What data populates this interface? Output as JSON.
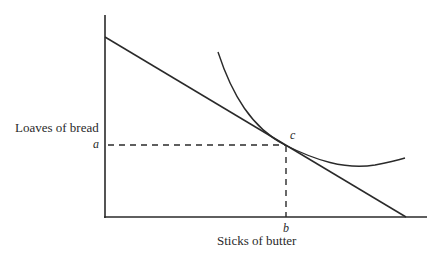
{
  "diagram": {
    "y_axis_label": "Loaves of bread",
    "x_axis_label": "Sticks of butter",
    "point_labels": {
      "y_intercept_marker": "a",
      "x_intercept_marker": "b",
      "tangency_point": "c"
    },
    "elements": [
      {
        "type": "axis",
        "name": "y-axis"
      },
      {
        "type": "axis",
        "name": "x-axis"
      },
      {
        "type": "line",
        "name": "budget-line",
        "description": "straight downward-sloping budget constraint"
      },
      {
        "type": "curve",
        "name": "indifference-curve",
        "description": "convex curve tangent to budget line at c"
      },
      {
        "type": "dashed-line",
        "name": "guide-a-to-c"
      },
      {
        "type": "dashed-line",
        "name": "guide-b-to-c"
      }
    ],
    "colors": {
      "stroke": "#2a2a2a",
      "background": "#ffffff"
    }
  }
}
